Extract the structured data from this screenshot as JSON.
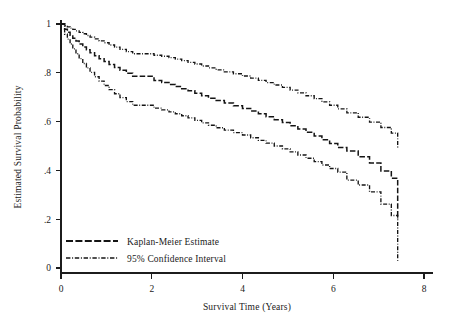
{
  "chart_data": {
    "type": "line",
    "title": "",
    "xlabel": "Survival Time (Years)",
    "ylabel": "Estimated Survival Probability",
    "xlim": [
      0,
      8
    ],
    "ylim": [
      0,
      1
    ],
    "xticks": [
      0,
      2,
      4,
      6,
      8
    ],
    "xtick_labels": [
      "0",
      "2",
      "4",
      "6",
      "8"
    ],
    "yticks": [
      0,
      0.2,
      0.4,
      0.6,
      0.8,
      1
    ],
    "ytick_labels": [
      "0",
      ".2",
      ".4",
      ".6",
      ".8",
      "1"
    ],
    "grid": false,
    "legend_position": "lower-left",
    "step_type": "post",
    "series": [
      {
        "name": "95% Confidence Interval Upper",
        "style": "dash-dot",
        "legend_key": "95% Confidence Interval",
        "x": [
          0.0,
          0.08,
          0.14,
          0.2,
          0.26,
          0.33,
          0.4,
          0.48,
          0.56,
          0.64,
          0.74,
          0.84,
          0.95,
          1.06,
          1.18,
          1.3,
          1.44,
          1.58,
          2.05,
          2.22,
          2.38,
          2.52,
          2.66,
          2.8,
          2.95,
          3.1,
          3.25,
          3.42,
          3.6,
          3.8,
          4.0,
          4.18,
          4.35,
          4.52,
          4.7,
          4.88,
          5.05,
          5.22,
          5.4,
          5.58,
          5.75,
          5.92,
          6.1,
          6.3,
          6.55,
          6.8,
          7.05,
          7.28,
          7.42
        ],
        "y": [
          1.0,
          0.993,
          0.988,
          0.983,
          0.978,
          0.972,
          0.966,
          0.96,
          0.953,
          0.946,
          0.939,
          0.931,
          0.923,
          0.914,
          0.905,
          0.896,
          0.887,
          0.878,
          0.872,
          0.868,
          0.862,
          0.856,
          0.85,
          0.843,
          0.836,
          0.828,
          0.82,
          0.812,
          0.804,
          0.796,
          0.787,
          0.778,
          0.769,
          0.76,
          0.75,
          0.74,
          0.729,
          0.718,
          0.706,
          0.694,
          0.681,
          0.667,
          0.652,
          0.636,
          0.618,
          0.598,
          0.576,
          0.553,
          0.492
        ]
      },
      {
        "name": "Kaplan-Meier Estimate",
        "style": "dashed",
        "legend_key": "Kaplan-Meier Estimate",
        "x": [
          0.0,
          0.08,
          0.14,
          0.2,
          0.26,
          0.33,
          0.4,
          0.48,
          0.56,
          0.64,
          0.74,
          0.84,
          0.95,
          1.06,
          1.18,
          1.3,
          1.44,
          1.58,
          2.05,
          2.22,
          2.38,
          2.52,
          2.66,
          2.8,
          2.95,
          3.1,
          3.25,
          3.42,
          3.6,
          3.8,
          4.0,
          4.18,
          4.35,
          4.52,
          4.7,
          4.88,
          5.05,
          5.22,
          5.4,
          5.58,
          5.75,
          5.92,
          6.1,
          6.3,
          6.55,
          6.8,
          7.05,
          7.28,
          7.42
        ],
        "y": [
          1.0,
          0.978,
          0.966,
          0.954,
          0.942,
          0.93,
          0.918,
          0.906,
          0.894,
          0.882,
          0.87,
          0.858,
          0.846,
          0.834,
          0.822,
          0.81,
          0.798,
          0.786,
          0.768,
          0.76,
          0.752,
          0.744,
          0.735,
          0.726,
          0.716,
          0.706,
          0.696,
          0.686,
          0.676,
          0.665,
          0.654,
          0.643,
          0.632,
          0.62,
          0.608,
          0.596,
          0.583,
          0.57,
          0.556,
          0.541,
          0.526,
          0.51,
          0.494,
          0.48,
          0.456,
          0.43,
          0.398,
          0.368,
          0.2
        ]
      },
      {
        "name": "95% Confidence Interval Lower",
        "style": "dash-dot",
        "legend_key": "95% Confidence Interval",
        "x": [
          0.0,
          0.08,
          0.14,
          0.2,
          0.26,
          0.33,
          0.4,
          0.48,
          0.56,
          0.64,
          0.74,
          0.84,
          0.95,
          1.06,
          1.18,
          1.3,
          1.44,
          1.58,
          2.05,
          2.22,
          2.38,
          2.52,
          2.66,
          2.8,
          2.95,
          3.1,
          3.25,
          3.42,
          3.6,
          3.8,
          4.0,
          4.18,
          4.35,
          4.52,
          4.7,
          4.88,
          5.05,
          5.22,
          5.4,
          5.58,
          5.75,
          5.92,
          6.1,
          6.3,
          6.55,
          6.8,
          7.05,
          7.28,
          7.42
        ],
        "y": [
          1.0,
          0.958,
          0.938,
          0.918,
          0.898,
          0.878,
          0.858,
          0.838,
          0.82,
          0.802,
          0.784,
          0.766,
          0.748,
          0.731,
          0.714,
          0.698,
          0.682,
          0.667,
          0.655,
          0.648,
          0.64,
          0.632,
          0.624,
          0.615,
          0.605,
          0.595,
          0.585,
          0.575,
          0.565,
          0.555,
          0.545,
          0.534,
          0.523,
          0.512,
          0.5,
          0.488,
          0.476,
          0.463,
          0.45,
          0.436,
          0.422,
          0.408,
          0.393,
          0.36,
          0.34,
          0.312,
          0.262,
          0.215,
          0.03
        ]
      }
    ],
    "annotations": []
  },
  "legend": {
    "items": [
      {
        "label": "Kaplan-Meier Estimate",
        "style": "dashed"
      },
      {
        "label": "95% Confidence Interval",
        "style": "dash-dot"
      }
    ]
  },
  "colors": {
    "ink": "#141414",
    "axis": "#1c1c1c",
    "background": "#ffffff"
  }
}
